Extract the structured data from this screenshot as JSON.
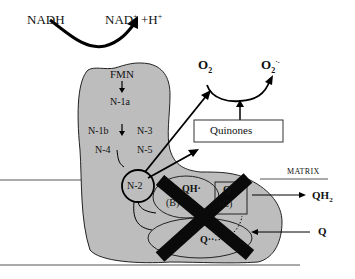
{
  "diagram": {
    "type": "mitochondrial complex I electron transfer schematic",
    "labels": {
      "nadh": "NADH",
      "nad": "NAD",
      "nad_sup": "+",
      "plus_h": " +H",
      "h_sup": "+",
      "fmn": "FMN",
      "n1a": "N-1a",
      "n1b": "N-1b",
      "n3": "N-3",
      "n4": "N-4",
      "n5": "N-5",
      "n2": "N-2",
      "o2": "O",
      "o2_sub": "2",
      "o2rad": "O",
      "o2rad_sub": "2",
      "o2rad_sup": "·-",
      "quinones": "Quinones",
      "matrix": "MATRIX",
      "qh2": "QH",
      "qh2_sub": "2",
      "q_out": "Q",
      "site_b_top": "QH·",
      "site_b_bot": "(B)",
      "site_c_top": "Q",
      "site_c_bot": "(C)",
      "site_a_q": "Q··",
      "site_a_bot": "(A)"
    },
    "colors": {
      "protein_fill": "#bdbdbd",
      "stroke": "#111111",
      "inhibitor_cross": "#0a0a0a"
    }
  }
}
